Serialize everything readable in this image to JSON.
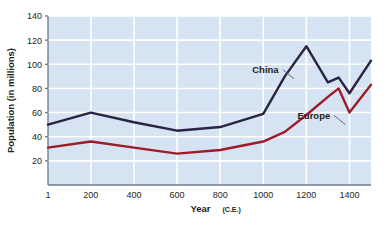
{
  "chart_data": {
    "type": "line",
    "title": "",
    "xlabel": "Year",
    "xlabel_suffix": "(C.E.)",
    "ylabel": "Population (in millions)",
    "xlim": [
      1,
      1500
    ],
    "ylim": [
      0,
      140
    ],
    "xticks": [
      "1",
      "200",
      "400",
      "600",
      "800",
      "1000",
      "1200",
      "1400"
    ],
    "xtick_values": [
      1,
      200,
      400,
      600,
      800,
      1000,
      1200,
      1400
    ],
    "yticks": [
      "20",
      "40",
      "60",
      "80",
      "100",
      "120",
      "140"
    ],
    "ytick_values": [
      20,
      40,
      60,
      80,
      100,
      120,
      140
    ],
    "grid": true,
    "legend_position": "inline-annotations",
    "plot_background": "#d5e3f2",
    "gridline_color": "#ffffff",
    "series": [
      {
        "name": "China",
        "color": "#2b2344",
        "label_x": 1010,
        "label_y": 93,
        "x": [
          1,
          200,
          400,
          600,
          800,
          1000,
          1100,
          1200,
          1300,
          1350,
          1400,
          1500
        ],
        "values": [
          50,
          60,
          52,
          45,
          48,
          59,
          90,
          115,
          85,
          89,
          76,
          103
        ]
      },
      {
        "name": "Europe",
        "color": "#9e1b28",
        "label_x": 1235,
        "label_y": 55,
        "x": [
          1,
          200,
          400,
          600,
          800,
          1000,
          1100,
          1200,
          1300,
          1350,
          1400,
          1500
        ],
        "values": [
          31,
          36,
          31,
          26,
          29,
          36,
          44,
          58,
          73,
          80,
          60,
          83
        ]
      }
    ]
  }
}
